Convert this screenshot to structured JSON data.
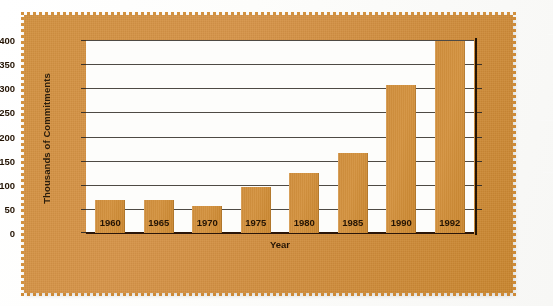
{
  "chart_data": {
    "type": "bar",
    "title": "",
    "subtitle": "",
    "xlabel": "Year",
    "ylabel": "Thousands of Commitments",
    "categories": [
      "1960",
      "1965",
      "1970",
      "1975",
      "1980",
      "1985",
      "1990",
      "1992"
    ],
    "values": [
      68,
      69,
      55,
      95,
      124,
      166,
      306,
      397
    ],
    "ylim": [
      0,
      400
    ],
    "yticks": [
      0,
      50,
      100,
      150,
      200,
      250,
      300,
      350,
      400
    ],
    "ytick_labels": [
      "0",
      "50",
      "100",
      "150",
      "200",
      "250",
      "300",
      "350",
      "400"
    ],
    "grid": "horizontal",
    "legend": "none",
    "series": [
      {
        "name": "Commitments",
        "values": [
          68,
          69,
          55,
          95,
          124,
          166,
          306,
          397
        ]
      }
    ]
  },
  "colors": {
    "bar": "#d08e3c",
    "panel_background": "#d2913f",
    "plot_background": "#fdfdfb",
    "gridline": "#4e4a44",
    "axis": "#241404",
    "text": "#241404",
    "page_background": "#ffffff"
  }
}
